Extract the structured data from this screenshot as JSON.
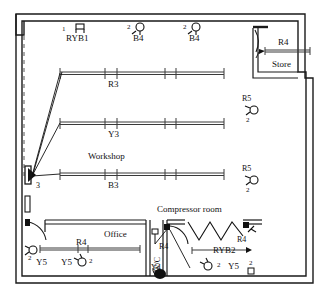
{
  "plan": {
    "title": "Workshop electrical lighting layout floor plan",
    "width": 323,
    "height": 297,
    "colors": {
      "wall": "#1a1a1a",
      "fixture": "#3a3a3a",
      "background": "#ffffff",
      "text": "#111111"
    }
  },
  "rooms": [
    {
      "name": "workshop",
      "label": "Workshop",
      "x": 88,
      "y": 152
    },
    {
      "name": "store",
      "label": "Store",
      "x": 272,
      "y": 65
    },
    {
      "name": "office",
      "label": "Office",
      "x": 98,
      "y": 233
    },
    {
      "name": "wc",
      "label": "W/C",
      "x": 148,
      "y": 268
    },
    {
      "name": "compressor-room",
      "label": "Compressor room",
      "x": 160,
      "y": 208
    }
  ],
  "circuits": [
    {
      "name": "ryb1",
      "label": "RYB1",
      "x": 72,
      "y": 40,
      "qty": "1",
      "qty_x": 65,
      "qty_y": 32
    },
    {
      "name": "b4-left",
      "label": "B4",
      "x": 133,
      "y": 42,
      "qty": "2",
      "qty_x": 127,
      "qty_y": 32
    },
    {
      "name": "b4-right",
      "label": "B4",
      "x": 189,
      "y": 42,
      "qty": "2",
      "qty_x": 183,
      "qty_y": 32
    },
    {
      "name": "r4-store",
      "label": "R4",
      "x": 275,
      "y": 42
    },
    {
      "name": "r3",
      "label": "R3",
      "x": 108,
      "y": 85
    },
    {
      "name": "y3",
      "label": "Y3",
      "x": 108,
      "y": 135
    },
    {
      "name": "b3",
      "label": "B3",
      "x": 108,
      "y": 185
    },
    {
      "name": "r5-upper",
      "label": "R5",
      "x": 243,
      "y": 98,
      "qty": "2",
      "qty_x": 245,
      "qty_y": 120
    },
    {
      "name": "r5-lower",
      "label": "R5",
      "x": 243,
      "y": 168,
      "qty": "2",
      "qty_x": 245,
      "qty_y": 190
    },
    {
      "name": "switch-3",
      "label": "3",
      "x": 35,
      "y": 188
    },
    {
      "name": "r4-office",
      "label": "R4",
      "x": 80,
      "y": 240
    },
    {
      "name": "y5-office-a",
      "label": "Y5",
      "x": 37,
      "y": 262,
      "qty": "2",
      "qty_x": 27,
      "qty_y": 259
    },
    {
      "name": "y5-office-b",
      "label": "Y5",
      "x": 60,
      "y": 262,
      "qty": "2",
      "qty_x": 89,
      "qty_y": 260
    },
    {
      "name": "r4-wc",
      "label": "R4",
      "x": 170,
      "y": 248
    },
    {
      "name": "y4",
      "label": "Y4",
      "x": 160,
      "y": 270
    },
    {
      "name": "ryb2",
      "label": "RYB2",
      "x": 218,
      "y": 251
    },
    {
      "name": "r4-comp",
      "label": "R4",
      "x": 238,
      "y": 240
    },
    {
      "name": "y5-comp",
      "label": "Y5",
      "x": 228,
      "y": 266,
      "qty": "2",
      "qty_x": 216,
      "qty_y": 266
    },
    {
      "name": "qty-corner",
      "label": "2",
      "x": 248,
      "y": 265
    }
  ]
}
